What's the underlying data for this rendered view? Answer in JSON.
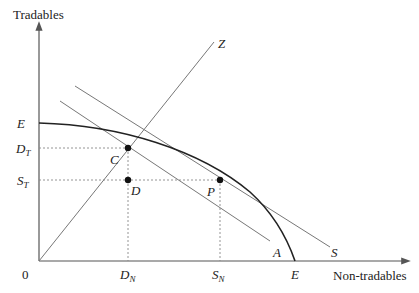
{
  "diagram": {
    "axes": {
      "y_label": "Tradables",
      "x_label": "Non-tradables",
      "origin_label": "0"
    },
    "curve": {
      "label_top": "E",
      "label_bottom": "E"
    },
    "lines": {
      "ray_label": "Z",
      "budget_supply_label": "S",
      "budget_absorption_label": "A"
    },
    "points": {
      "C": "C",
      "D": "D",
      "P": "P"
    },
    "y_ticks": {
      "E": "E",
      "DT_main": "D",
      "DT_sub": "T",
      "ST_main": "S",
      "ST_sub": "T"
    },
    "x_ticks": {
      "DN_main": "D",
      "DN_sub": "N",
      "SN_main": "S",
      "SN_sub": "N",
      "E": "E"
    },
    "colors": {
      "curve": "#222222",
      "line": "#777777",
      "dotted": "#888888"
    }
  }
}
